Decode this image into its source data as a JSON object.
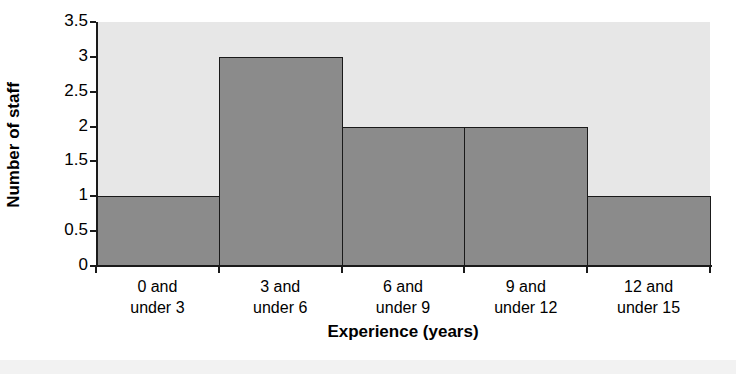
{
  "chart_data": {
    "type": "bar",
    "title": "",
    "xlabel": "Experience (years)",
    "ylabel": "Number of staff",
    "categories": [
      "0 and under 3",
      "3 and under 6",
      "6 and under 9",
      "9 and under 12",
      "12 and under 15"
    ],
    "category_lines": [
      [
        "0 and",
        "under 3"
      ],
      [
        "3 and",
        "under 6"
      ],
      [
        "6 and",
        "under 9"
      ],
      [
        "9 and",
        "under 12"
      ],
      [
        "12 and",
        "under 15"
      ]
    ],
    "values": [
      1,
      3,
      2,
      2,
      1
    ],
    "ylim": [
      0,
      3.5
    ],
    "yticks": [
      0,
      0.5,
      1,
      1.5,
      2,
      2.5,
      3,
      3.5
    ],
    "ytick_labels": [
      "0",
      "0.5",
      "1",
      "1.5",
      "2",
      "2.5",
      "3",
      "3.5"
    ],
    "grid": false,
    "legend": false,
    "bar_gap": 0,
    "colors": {
      "bar_fill": "#8b8b8b",
      "bar_edge": "#1a1a1a",
      "plot_background": "#e7e7e7",
      "axis": "#1a1a1a",
      "text": "#000000",
      "page_background": "#ffffff"
    }
  }
}
